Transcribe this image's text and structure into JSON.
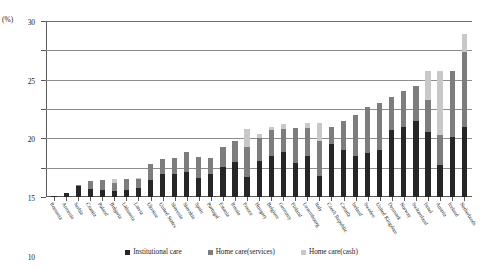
{
  "chart_data": {
    "type": "bar",
    "stacked": true,
    "title": "",
    "subtitle": "",
    "xlabel": "",
    "ylabel": "(%)",
    "ylim": [
      0,
      30
    ],
    "yticks": [
      0,
      5,
      10,
      15,
      20,
      25,
      30
    ],
    "grid": true,
    "legend_position": "bottom",
    "unit_label": "(%)",
    "categories": [
      "Romania",
      "Armenia",
      "Serbia",
      "Croatia",
      "Poland",
      "Bulgaria",
      "Lithuania",
      "Latvia",
      "Ukraine",
      "United States",
      "Slovenia",
      "Slovakia",
      "Spain",
      "Portugal",
      "Estonia",
      "Russia",
      "France",
      "Hungary",
      "Belgium",
      "Germany",
      "Finland",
      "Luxembourg",
      "Italy",
      "Czech Republic",
      "Canada",
      "Ireland",
      "Sweden",
      "United Kingdom",
      "Denmark",
      "Norway",
      "Switzerland",
      "Israel",
      "Austria",
      "Iceland",
      "Netherlands"
    ],
    "series": [
      {
        "name": "Institutional care",
        "color": "#262626",
        "values": [
          0.1,
          0.6,
          1.8,
          1.3,
          1.2,
          1.0,
          1.2,
          1.6,
          2.9,
          4.0,
          4.0,
          4.2,
          3.2,
          3.9,
          5.1,
          6.0,
          3.4,
          6.1,
          7.0,
          7.6,
          5.8,
          7.0,
          3.5,
          9.0,
          8.0,
          7.0,
          7.5,
          8.0,
          11.5,
          12.0,
          13.0,
          11.0,
          5.5,
          10.2,
          12.0
        ]
      },
      {
        "name": "Home care(services)",
        "color": "#7d7d7d",
        "values": [
          0.0,
          0.1,
          0.2,
          1.5,
          1.7,
          1.4,
          1.8,
          1.5,
          2.8,
          2.5,
          2.6,
          3.4,
          3.6,
          2.8,
          3.4,
          3.5,
          5.2,
          4.0,
          4.4,
          4.0,
          6.0,
          4.8,
          6.0,
          3.0,
          5.0,
          7.0,
          7.8,
          8.0,
          5.5,
          6.0,
          6.0,
          5.5,
          5.0,
          11.3,
          12.8
        ]
      },
      {
        "name": "Home care(cash)",
        "color": "#c8c8c8",
        "values": [
          0.0,
          0.0,
          0.0,
          0.0,
          0.0,
          0.6,
          0.0,
          0.1,
          0.0,
          0.0,
          0.0,
          0.0,
          0.0,
          0.0,
          0.0,
          0.0,
          3.0,
          0.7,
          0.5,
          0.8,
          0.0,
          0.8,
          3.1,
          0.0,
          0.0,
          0.0,
          0.0,
          0.0,
          0.0,
          0.0,
          0.0,
          5.0,
          11.0,
          0.0,
          3.0
        ]
      }
    ],
    "totals": [
      0.1,
      0.7,
      2.0,
      2.8,
      2.9,
      3.0,
      3.0,
      3.2,
      5.7,
      6.5,
      6.6,
      7.6,
      6.8,
      6.7,
      8.5,
      9.5,
      11.6,
      10.8,
      11.9,
      12.4,
      11.8,
      12.6,
      12.6,
      12.0,
      13.0,
      14.0,
      15.3,
      16.0,
      17.0,
      18.0,
      19.0,
      21.5,
      21.5,
      21.5,
      27.8
    ]
  },
  "legend": {
    "items": [
      {
        "label": "Institutional care",
        "color": "#262626"
      },
      {
        "label": "Home care(services)",
        "color": "#7d7d7d"
      },
      {
        "label": "Home care(cash)",
        "color": "#c8c8c8"
      }
    ]
  },
  "axis": {
    "y_unit": "(%)",
    "y_tick_labels": [
      "0",
      "5",
      "10",
      "15",
      "20",
      "25",
      "30"
    ]
  }
}
